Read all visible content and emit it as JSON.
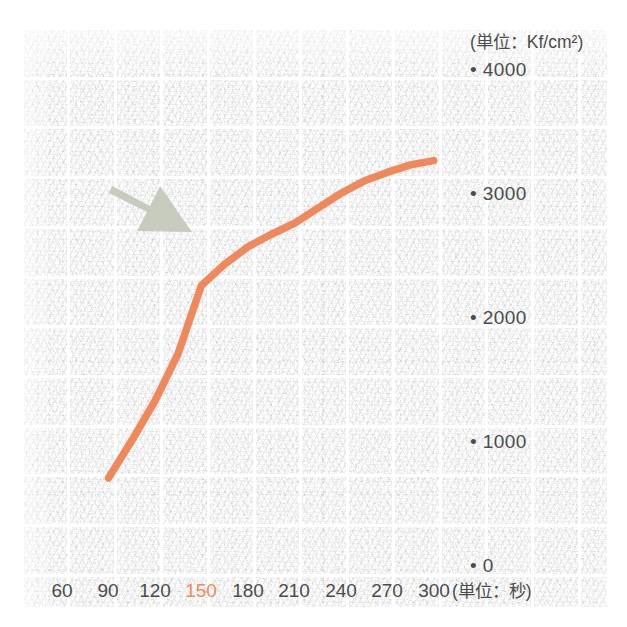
{
  "chart_data": {
    "type": "line",
    "title": "",
    "subtitle": "",
    "xlabel": "(単位：秒)",
    "ylabel": "(単位：Kf/cm²)",
    "x": [
      90,
      105,
      120,
      135,
      150,
      165,
      180,
      195,
      210,
      225,
      240,
      255,
      270,
      285,
      300
    ],
    "values": [
      700,
      1000,
      1320,
      1700,
      2250,
      2420,
      2560,
      2660,
      2750,
      2870,
      2990,
      3090,
      3160,
      3220,
      3255
    ],
    "series": [
      {
        "name": "強度",
        "color": "#f0885b",
        "values": [
          700,
          1000,
          1320,
          1700,
          2250,
          2420,
          2560,
          2660,
          2750,
          2870,
          2990,
          3090,
          3160,
          3220,
          3255
        ]
      }
    ],
    "xlim": [
      45,
      315
    ],
    "ylim": [
      0,
      4000
    ],
    "xticks": [
      60,
      90,
      120,
      150,
      180,
      210,
      240,
      270,
      300
    ],
    "yticks": [
      0,
      1000,
      2000,
      3000,
      4000
    ],
    "xtick_labels": [
      "60",
      "90",
      "120",
      "150",
      "180",
      "210",
      "240",
      "270",
      "300"
    ],
    "ytick_labels": [
      "0",
      "1000",
      "2000",
      "3000",
      "4000"
    ],
    "highlighted_xtick": "150",
    "highlight_color": "#ee8a5e",
    "grid": true,
    "grid_style": "white ruled grid on textured paper",
    "legend": "none",
    "annotations": [
      {
        "type": "arrow",
        "name": "inflection-arrow",
        "color": "#c3c8ba",
        "points_to_x": 150,
        "points_to_y": 2250,
        "direction": "down-right"
      }
    ]
  },
  "axes": {
    "y_unit_label": "(単位：Kf/cm²)",
    "x_unit_label": "(単位：秒)",
    "y_tick_marker": "•",
    "y_labels": [
      {
        "value": 4000,
        "text": "4000"
      },
      {
        "value": 3000,
        "text": "3000"
      },
      {
        "value": 2000,
        "text": "2000"
      },
      {
        "value": 1000,
        "text": "1000"
      },
      {
        "value": 0,
        "text": "0"
      }
    ],
    "x_labels": [
      {
        "value": 60,
        "text": "60",
        "highlight": false
      },
      {
        "value": 90,
        "text": "90",
        "highlight": false
      },
      {
        "value": 120,
        "text": "120",
        "highlight": false
      },
      {
        "value": 150,
        "text": "150",
        "highlight": true
      },
      {
        "value": 180,
        "text": "180",
        "highlight": false
      },
      {
        "value": 210,
        "text": "210",
        "highlight": false
      },
      {
        "value": 240,
        "text": "240",
        "highlight": false
      },
      {
        "value": 270,
        "text": "270",
        "highlight": false
      },
      {
        "value": 300,
        "text": "300",
        "highlight": false
      }
    ]
  },
  "colors": {
    "line": "#f0885b",
    "arrow": "#c3c8ba",
    "text": "#4c4c4c",
    "highlight": "#ee8a5e",
    "paper": "#fdfdfd"
  }
}
